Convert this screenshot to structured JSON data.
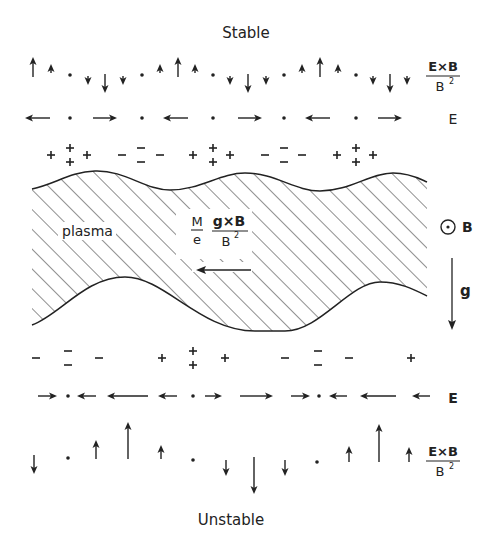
{
  "title_top": "Stable",
  "title_bottom": "Unstable",
  "colors": {
    "ink": "#222222",
    "background": "#ffffff"
  },
  "labels": {
    "exb_num": "E×B",
    "exb_den": "B",
    "exb_den_sup": "2",
    "e_field": "E",
    "plasma": "plasma",
    "drift_coef_num": "M",
    "drift_coef_den": "e",
    "drift_num": "g×B",
    "drift_den": "B",
    "drift_den_sup": "2",
    "b_field": "B",
    "b_field_symbol": "out-of-page-icon",
    "gravity": "g"
  },
  "stable": {
    "exb_row": [
      {
        "x": 33,
        "dir": "up",
        "size": "big"
      },
      {
        "x": 51,
        "dir": "up",
        "size": "small"
      },
      {
        "x": 70,
        "dir": "dot"
      },
      {
        "x": 88,
        "dir": "down",
        "size": "small"
      },
      {
        "x": 105,
        "dir": "down",
        "size": "big"
      },
      {
        "x": 123,
        "dir": "down",
        "size": "small"
      },
      {
        "x": 142,
        "dir": "dot"
      },
      {
        "x": 160,
        "dir": "up",
        "size": "small"
      },
      {
        "x": 178,
        "dir": "up",
        "size": "big"
      },
      {
        "x": 195,
        "dir": "up",
        "size": "small"
      },
      {
        "x": 213,
        "dir": "dot"
      },
      {
        "x": 230,
        "dir": "down",
        "size": "small"
      },
      {
        "x": 248,
        "dir": "down",
        "size": "big"
      },
      {
        "x": 266,
        "dir": "down",
        "size": "small"
      },
      {
        "x": 284,
        "dir": "dot"
      },
      {
        "x": 302,
        "dir": "up",
        "size": "small"
      },
      {
        "x": 320,
        "dir": "up",
        "size": "big"
      },
      {
        "x": 338,
        "dir": "up",
        "size": "small"
      },
      {
        "x": 356,
        "dir": "dot"
      },
      {
        "x": 373,
        "dir": "down",
        "size": "small"
      },
      {
        "x": 390,
        "dir": "down",
        "size": "big"
      },
      {
        "x": 407,
        "dir": "down",
        "size": "small"
      }
    ],
    "e_row": [
      {
        "x1": 50,
        "x2": 25,
        "dir": "left"
      },
      {
        "x": 70,
        "dir": "dot"
      },
      {
        "x1": 93,
        "x2": 117,
        "dir": "right"
      },
      {
        "x": 142,
        "dir": "dot"
      },
      {
        "x1": 188,
        "x2": 163,
        "dir": "left"
      },
      {
        "x": 213,
        "dir": "dot"
      },
      {
        "x1": 238,
        "x2": 262,
        "dir": "right"
      },
      {
        "x": 284,
        "dir": "dot"
      },
      {
        "x1": 330,
        "x2": 305,
        "dir": "left"
      },
      {
        "x": 356,
        "dir": "dot"
      },
      {
        "x1": 378,
        "x2": 402,
        "dir": "right"
      }
    ],
    "charges": [
      {
        "x": 51,
        "sign": "+",
        "n": 1
      },
      {
        "x": 70,
        "sign": "+",
        "n": 2
      },
      {
        "x": 87,
        "sign": "+",
        "n": 1
      },
      {
        "x": 122,
        "sign": "-",
        "n": 1
      },
      {
        "x": 141,
        "sign": "-",
        "n": 2
      },
      {
        "x": 160,
        "sign": "-",
        "n": 1
      },
      {
        "x": 193,
        "sign": "+",
        "n": 1
      },
      {
        "x": 213,
        "sign": "+",
        "n": 2
      },
      {
        "x": 230,
        "sign": "+",
        "n": 1
      },
      {
        "x": 265,
        "sign": "-",
        "n": 1
      },
      {
        "x": 284,
        "sign": "-",
        "n": 2
      },
      {
        "x": 302,
        "sign": "-",
        "n": 1
      },
      {
        "x": 337,
        "sign": "+",
        "n": 1
      },
      {
        "x": 356,
        "sign": "+",
        "n": 2
      },
      {
        "x": 373,
        "sign": "+",
        "n": 1
      }
    ]
  },
  "unstable": {
    "charges": [
      {
        "x": 36,
        "sign": "-",
        "n": 1
      },
      {
        "x": 68,
        "sign": "-",
        "n": 2
      },
      {
        "x": 99,
        "sign": "-",
        "n": 1
      },
      {
        "x": 162,
        "sign": "+",
        "n": 1
      },
      {
        "x": 193,
        "sign": "+",
        "n": 2
      },
      {
        "x": 225,
        "sign": "+",
        "n": 1
      },
      {
        "x": 285,
        "sign": "-",
        "n": 1
      },
      {
        "x": 318,
        "sign": "-",
        "n": 2
      },
      {
        "x": 349,
        "sign": "-",
        "n": 1
      },
      {
        "x": 411,
        "sign": "+",
        "n": 1
      }
    ],
    "e_row": [
      {
        "x1": 38,
        "x2": 57,
        "dir": "right"
      },
      {
        "x": 68,
        "dir": "dot"
      },
      {
        "x1": 96,
        "x2": 77,
        "dir": "left"
      },
      {
        "x1": 148,
        "x2": 107,
        "dir": "left"
      },
      {
        "x1": 177,
        "x2": 158,
        "dir": "left"
      },
      {
        "x": 193,
        "dir": "dot"
      },
      {
        "x1": 205,
        "x2": 222,
        "dir": "right"
      },
      {
        "x1": 240,
        "x2": 273,
        "dir": "right"
      },
      {
        "x1": 291,
        "x2": 310,
        "dir": "right"
      },
      {
        "x": 319,
        "dir": "dot"
      },
      {
        "x1": 347,
        "x2": 329,
        "dir": "left"
      },
      {
        "x1": 396,
        "x2": 360,
        "dir": "left"
      },
      {
        "x1": 430,
        "x2": 412,
        "dir": "left"
      }
    ],
    "exb_row": [
      {
        "x": 34,
        "y1": 455,
        "y2": 474
      },
      {
        "x": 68,
        "dot": 458
      },
      {
        "x": 96,
        "y1": 459,
        "y2": 440
      },
      {
        "x": 128,
        "y1": 459,
        "y2": 422
      },
      {
        "x": 161,
        "y1": 459,
        "y2": 445
      },
      {
        "x": 193,
        "dot": 460
      },
      {
        "x": 226,
        "y1": 460,
        "y2": 476
      },
      {
        "x": 254,
        "y1": 457,
        "y2": 494
      },
      {
        "x": 285,
        "y1": 460,
        "y2": 476
      },
      {
        "x": 317,
        "dot": 462
      },
      {
        "x": 349,
        "y1": 462,
        "y2": 446
      },
      {
        "x": 379,
        "y1": 462,
        "y2": 424
      },
      {
        "x": 409,
        "y1": 462,
        "y2": 447
      }
    ]
  }
}
